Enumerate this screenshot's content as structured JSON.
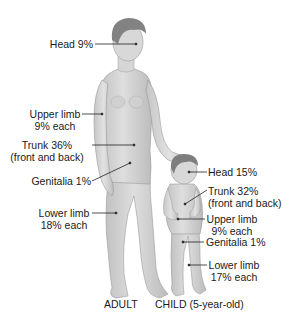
{
  "adult": {
    "caption": "ADULT",
    "labels": {
      "head": "Head 9%",
      "upper_limb_1": "Upper limb",
      "upper_limb_2": "9% each",
      "trunk_1": "Trunk 36%",
      "trunk_2": "(front and back)",
      "genitalia": "Genitalia 1%",
      "lower_limb_1": "Lower limb",
      "lower_limb_2": "18% each"
    }
  },
  "child": {
    "caption": "CHILD (5-year-old)",
    "labels": {
      "head": "Head 15%",
      "trunk_1": "Trunk 32%",
      "trunk_2": "(front and back)",
      "upper_limb_1": "Upper limb",
      "upper_limb_2": "9% each",
      "genitalia": "Genitalia 1%",
      "lower_limb_1": "Lower limb",
      "lower_limb_2": "17% each"
    }
  },
  "colors": {
    "skin": "#d4d4d4",
    "skin_shadow": "#b0b0b0",
    "hair": "#7a7a7a",
    "leader": "#222222"
  }
}
